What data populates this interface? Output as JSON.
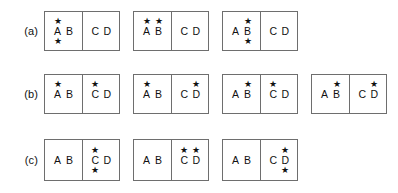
{
  "figure": {
    "background_color": "#ffffff",
    "box_border_color": "#6e6e6e",
    "text_color": "#111111",
    "star_glyph": "★",
    "cells": {
      "left_letters": [
        "A",
        "B"
      ],
      "right_letters": [
        "C",
        "D"
      ]
    }
  },
  "rows": [
    {
      "label": "(a)",
      "boxes": [
        {
          "left": [
            {
              "letter": "A",
              "star_above": "★",
              "star_below": "★"
            },
            {
              "letter": "B",
              "star_above": "",
              "star_below": ""
            }
          ],
          "right": [
            {
              "letter": "C",
              "star_above": "",
              "star_below": ""
            },
            {
              "letter": "D",
              "star_above": "",
              "star_below": ""
            }
          ]
        },
        {
          "left": [
            {
              "letter": "A",
              "star_above": "★",
              "star_below": ""
            },
            {
              "letter": "B",
              "star_above": "★",
              "star_below": ""
            }
          ],
          "right": [
            {
              "letter": "C",
              "star_above": "",
              "star_below": ""
            },
            {
              "letter": "D",
              "star_above": "",
              "star_below": ""
            }
          ]
        },
        {
          "left": [
            {
              "letter": "A",
              "star_above": "",
              "star_below": ""
            },
            {
              "letter": "B",
              "star_above": "★",
              "star_below": "★"
            }
          ],
          "right": [
            {
              "letter": "C",
              "star_above": "",
              "star_below": ""
            },
            {
              "letter": "D",
              "star_above": "",
              "star_below": ""
            }
          ]
        }
      ]
    },
    {
      "label": "(b)",
      "boxes": [
        {
          "left": [
            {
              "letter": "A",
              "star_above": "★",
              "star_below": ""
            },
            {
              "letter": "B",
              "star_above": "",
              "star_below": ""
            }
          ],
          "right": [
            {
              "letter": "C",
              "star_above": "★",
              "star_below": ""
            },
            {
              "letter": "D",
              "star_above": "",
              "star_below": ""
            }
          ]
        },
        {
          "left": [
            {
              "letter": "A",
              "star_above": "★",
              "star_below": ""
            },
            {
              "letter": "B",
              "star_above": "",
              "star_below": ""
            }
          ],
          "right": [
            {
              "letter": "C",
              "star_above": "",
              "star_below": ""
            },
            {
              "letter": "D",
              "star_above": "★",
              "star_below": ""
            }
          ]
        },
        {
          "left": [
            {
              "letter": "A",
              "star_above": "",
              "star_below": ""
            },
            {
              "letter": "B",
              "star_above": "★",
              "star_below": ""
            }
          ],
          "right": [
            {
              "letter": "C",
              "star_above": "★",
              "star_below": ""
            },
            {
              "letter": "D",
              "star_above": "",
              "star_below": ""
            }
          ]
        },
        {
          "left": [
            {
              "letter": "A",
              "star_above": "",
              "star_below": ""
            },
            {
              "letter": "B",
              "star_above": "★",
              "star_below": ""
            }
          ],
          "right": [
            {
              "letter": "C",
              "star_above": "",
              "star_below": ""
            },
            {
              "letter": "D",
              "star_above": "★",
              "star_below": ""
            }
          ]
        }
      ]
    },
    {
      "label": "(c)",
      "boxes": [
        {
          "left": [
            {
              "letter": "A",
              "star_above": "",
              "star_below": ""
            },
            {
              "letter": "B",
              "star_above": "",
              "star_below": ""
            }
          ],
          "right": [
            {
              "letter": "C",
              "star_above": "★",
              "star_below": "★"
            },
            {
              "letter": "D",
              "star_above": "",
              "star_below": ""
            }
          ]
        },
        {
          "left": [
            {
              "letter": "A",
              "star_above": "",
              "star_below": ""
            },
            {
              "letter": "B",
              "star_above": "",
              "star_below": ""
            }
          ],
          "right": [
            {
              "letter": "C",
              "star_above": "★",
              "star_below": ""
            },
            {
              "letter": "D",
              "star_above": "★",
              "star_below": ""
            }
          ]
        },
        {
          "left": [
            {
              "letter": "A",
              "star_above": "",
              "star_below": ""
            },
            {
              "letter": "B",
              "star_above": "",
              "star_below": ""
            }
          ],
          "right": [
            {
              "letter": "C",
              "star_above": "",
              "star_below": ""
            },
            {
              "letter": "D",
              "star_above": "★",
              "star_below": "★"
            }
          ]
        }
      ]
    }
  ]
}
